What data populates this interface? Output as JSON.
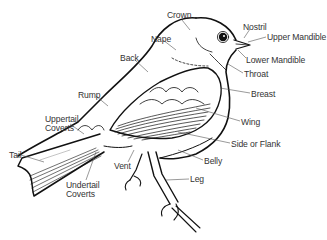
{
  "diagram": {
    "colors": {
      "line": "#111111",
      "leader": "#555555",
      "text": "#333333",
      "background": "#ffffff"
    },
    "labels": [
      {
        "id": "crown",
        "text": "Crown",
        "x": 167,
        "y": 11
      },
      {
        "id": "nostril",
        "text": "Nostril",
        "x": 243,
        "y": 23
      },
      {
        "id": "upper-mandible",
        "text": "Upper Mandible",
        "x": 267,
        "y": 33
      },
      {
        "id": "nape",
        "text": "Nape",
        "x": 151,
        "y": 35
      },
      {
        "id": "back",
        "text": "Back",
        "x": 120,
        "y": 54
      },
      {
        "id": "lower-mandible",
        "text": "Lower Mandible",
        "x": 246,
        "y": 56
      },
      {
        "id": "throat",
        "text": "Throat",
        "x": 244,
        "y": 70
      },
      {
        "id": "rump",
        "text": "Rump",
        "x": 78,
        "y": 91
      },
      {
        "id": "breast",
        "text": "Breast",
        "x": 251,
        "y": 90
      },
      {
        "id": "uppertail-coverts-1",
        "text": "Uppertail",
        "x": 45,
        "y": 115
      },
      {
        "id": "uppertail-coverts-2",
        "text": "Coverts",
        "x": 45,
        "y": 124
      },
      {
        "id": "wing",
        "text": "Wing",
        "x": 241,
        "y": 118
      },
      {
        "id": "side-or-flank",
        "text": "Side or Flank",
        "x": 231,
        "y": 140
      },
      {
        "id": "tail",
        "text": "Tail",
        "x": 9,
        "y": 151
      },
      {
        "id": "vent",
        "text": "Vent",
        "x": 114,
        "y": 162
      },
      {
        "id": "belly",
        "text": "Belly",
        "x": 204,
        "y": 157
      },
      {
        "id": "undertail-coverts-1",
        "text": "Undertail",
        "x": 66,
        "y": 181
      },
      {
        "id": "undertail-coverts-2",
        "text": "Coverts",
        "x": 66,
        "y": 190
      },
      {
        "id": "leg",
        "text": "Leg",
        "x": 190,
        "y": 175
      }
    ]
  }
}
